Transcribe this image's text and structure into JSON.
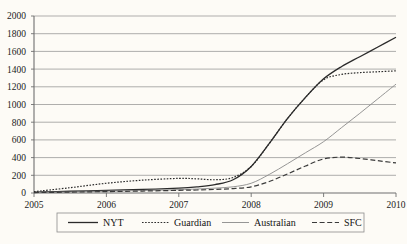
{
  "chart_data": {
    "type": "line",
    "title": "",
    "xlabel": "",
    "ylabel": "",
    "xlim": [
      2005,
      2010
    ],
    "ylim": [
      0,
      2000
    ],
    "grid": true,
    "legend_position": "bottom",
    "xticks": [
      "2005",
      "2006",
      "2007",
      "2008",
      "2009",
      "2010"
    ],
    "yticks": [
      "0",
      "200",
      "400",
      "600",
      "800",
      "1000",
      "1200",
      "1400",
      "1600",
      "1800",
      "2000"
    ],
    "x": [
      2005,
      2005.5,
      2006,
      2006.5,
      2007,
      2007.25,
      2007.5,
      2007.75,
      2008,
      2008.25,
      2008.5,
      2008.75,
      2009,
      2009.25,
      2009.5,
      2009.75,
      2010
    ],
    "series": [
      {
        "name": "NYT",
        "style": "solid",
        "color": "#2b2b2b",
        "values": [
          10,
          20,
          30,
          40,
          55,
          70,
          95,
          150,
          300,
          560,
          840,
          1080,
          1290,
          1430,
          1540,
          1650,
          1760
        ]
      },
      {
        "name": "Guardian",
        "style": "dotted",
        "color": "#2b2b2b",
        "values": [
          15,
          60,
          110,
          145,
          165,
          160,
          150,
          175,
          300,
          560,
          840,
          1080,
          1280,
          1340,
          1360,
          1370,
          1380
        ]
      },
      {
        "name": "Australian",
        "style": "thin-solid",
        "color": "#8a8a8a",
        "values": [
          5,
          12,
          20,
          28,
          38,
          45,
          55,
          70,
          110,
          210,
          330,
          455,
          580,
          740,
          900,
          1065,
          1230
        ]
      },
      {
        "name": "SFC",
        "style": "dashed",
        "color": "#3a3a3a",
        "values": [
          5,
          10,
          16,
          22,
          30,
          34,
          40,
          50,
          70,
          130,
          215,
          305,
          385,
          405,
          390,
          365,
          340
        ]
      }
    ]
  },
  "legend": {
    "items": [
      {
        "label": "NYT"
      },
      {
        "label": "Guardian"
      },
      {
        "label": "Australian"
      },
      {
        "label": "SFC"
      }
    ]
  }
}
